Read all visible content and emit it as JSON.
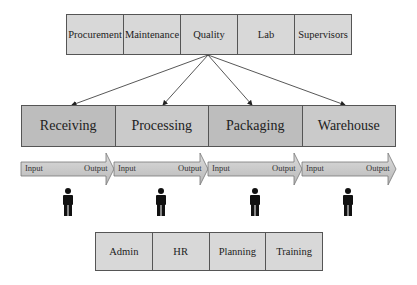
{
  "top_departments": {
    "items": [
      {
        "label": "Procurement"
      },
      {
        "label": "Maintenance"
      },
      {
        "label": "Quality"
      },
      {
        "label": "Lab"
      },
      {
        "label": "Supervisors"
      }
    ]
  },
  "process_stages": {
    "items": [
      {
        "label": "Receiving",
        "input": "Input",
        "output": "Output"
      },
      {
        "label": "Processing",
        "input": "Input",
        "output": "Output"
      },
      {
        "label": "Packaging",
        "input": "Input",
        "output": "Output"
      },
      {
        "label": "Warehouse",
        "input": "Input",
        "output": "Output"
      }
    ]
  },
  "support_departments": {
    "items": [
      {
        "label": "Admin"
      },
      {
        "label": "HR"
      },
      {
        "label": "Planning"
      },
      {
        "label": "Training"
      }
    ]
  },
  "icons": {
    "worker": "person-icon",
    "connector": "arrow-icon",
    "flow": "block-arrow-icon"
  },
  "colors": {
    "top_fill": "#d8d8d8",
    "process_fill": "#bdbdbd",
    "arrow_fill": "#c9c9c9",
    "border": "#555555",
    "person": "#111111"
  }
}
